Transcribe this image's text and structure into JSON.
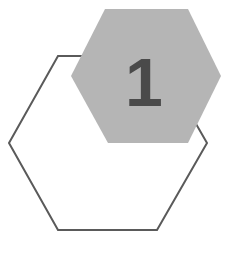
{
  "diagram": {
    "step_number": "1",
    "colors": {
      "background": "#ffffff",
      "outline_stroke": "#5a5a5a",
      "badge_fill": "#b5b5b5",
      "number_color": "#4a4a4a"
    },
    "outline_hexagon": {
      "points": "58,56 157,56 207,143 157,230 58,230 9,143"
    },
    "badge_hexagon": {
      "points": "105,9 188,9 221,76 188,143 108,143 71,76"
    }
  }
}
